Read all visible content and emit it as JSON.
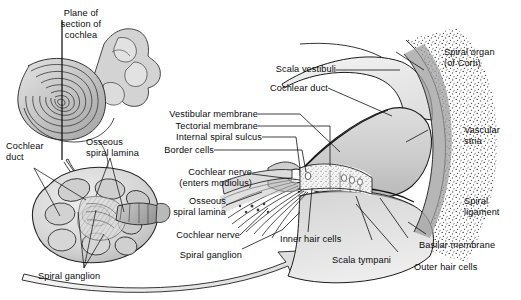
{
  "figure": {
    "type": "anatomical-illustration",
    "style": "grayscale pen-and-ink medical illustration",
    "background_color": "#ffffff",
    "ink_color": "#1a1a1a",
    "fill_light": "#d9d9d9",
    "fill_mid": "#bdbdbd",
    "fill_dark": "#8f8f8f"
  },
  "panels": {
    "inset_plane": {
      "name": "cochlea-plane-of-section-inset",
      "caption_lines": [
        "Plane of",
        "section of",
        "cochlea"
      ],
      "caption_text": "Plane of section of cochlea"
    },
    "cut_cochlea": {
      "name": "sectioned-cochlea-spiral",
      "labels": [
        "Cochlear duct",
        "Osseous spiral lamina",
        "Spiral ganglion"
      ]
    },
    "detail": {
      "name": "organ-of-corti-detail",
      "labels": [
        "Scala vestibuli",
        "Cochlear duct",
        "Vestibular membrane",
        "Tectorial membrane",
        "Internal spiral sulcus",
        "Border cells",
        "Cochlear nerve (enters modiolus)",
        "Osseous spiral lamina",
        "Cochlear nerve",
        "Spiral ganglion",
        "Inner hair cells",
        "Scala tympani",
        "Spiral organ (of Corti)",
        "Vascular stria",
        "Spiral ligament",
        "Basilar membrane",
        "Outer hair cells"
      ]
    }
  },
  "labels": {
    "plane_of": "Plane of",
    "section_of": "section of",
    "cochlea": "cochlea",
    "cochlear_duct_left_1": "Cochlear",
    "cochlear_duct_left_2": "duct",
    "osseous_spiral_lamina_left_1": "Osseous",
    "osseous_spiral_lamina_left_2": "spiral lamina",
    "spiral_ganglion_left": "Spiral ganglion",
    "scala_vestibuli": "Scala vestibuli",
    "cochlear_duct_top": "Cochlear duct",
    "vestibular_membrane": "Vestibular membrane",
    "tectorial_membrane": "Tectorial membrane",
    "internal_spiral_sulcus": "Internal spiral sulcus",
    "border_cells": "Border cells",
    "cochlear_nerve_modiolus_1": "Cochlear nerve",
    "cochlear_nerve_modiolus_2": "(enters modiolus)",
    "osseous_spiral_lamina_mid_1": "Osseous",
    "osseous_spiral_lamina_mid_2": "spiral lamina",
    "cochlear_nerve": "Cochlear nerve",
    "spiral_ganglion_mid": "Spiral ganglion",
    "inner_hair_cells": "Inner hair cells",
    "scala_tympani": "Scala tympani",
    "spiral_organ_1": "Spiral organ",
    "spiral_organ_2": "(of Corti)",
    "vascular_stria_1": "Vascular",
    "vascular_stria_2": "stria",
    "spiral_ligament_1": "Spiral",
    "spiral_ligament_2": "ligament",
    "basilar_membrane": "Basilar membrane",
    "outer_hair_cells": "Outer hair cells"
  }
}
